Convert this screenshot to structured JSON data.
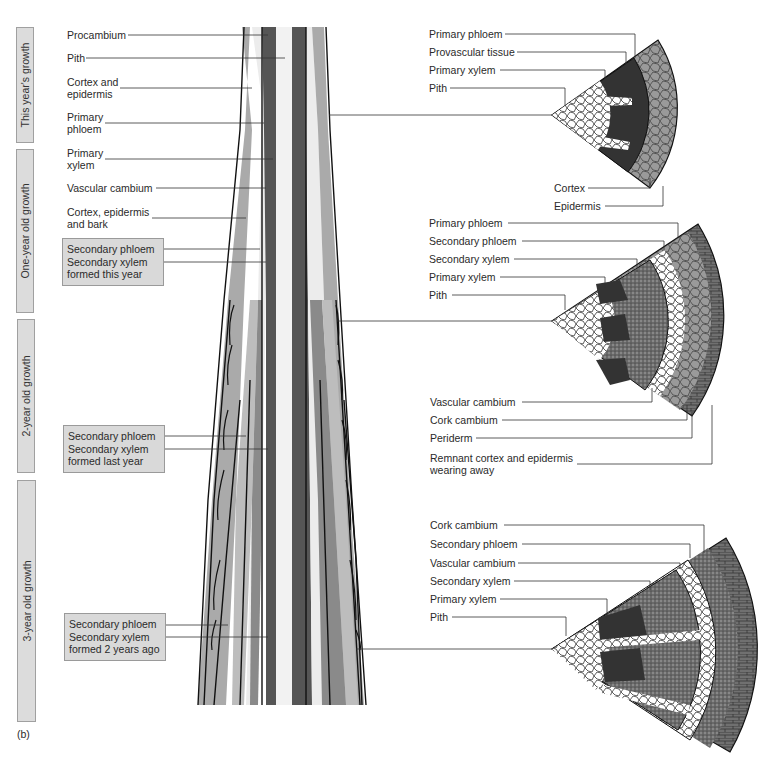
{
  "figure_label": "(b)",
  "growth_bars": [
    {
      "label": "This year's growth"
    },
    {
      "label": "One-year old growth"
    },
    {
      "label": "2-year old growth"
    },
    {
      "label": "3-year old growth"
    }
  ],
  "stem_labels": {
    "procambium": "Procambium",
    "pith": "Pith",
    "cortex_epidermis": [
      "Cortex and",
      "epidermis"
    ],
    "primary_phloem": [
      "Primary",
      "phloem"
    ],
    "primary_xylem": [
      "Primary",
      "xylem"
    ],
    "vascular_cambium": "Vascular cambium",
    "cortex_epidermis_bark": [
      "Cortex, epidermis",
      "and bark"
    ]
  },
  "stem_boxes": [
    {
      "lines": [
        "Secondary phloem",
        "Secondary xylem",
        "formed this year"
      ]
    },
    {
      "lines": [
        "Secondary phloem",
        "Secondary xylem",
        "formed last year"
      ]
    },
    {
      "lines": [
        "Secondary phloem",
        "Secondary xylem",
        "formed 2 years ago"
      ]
    }
  ],
  "section_1": {
    "left_labels": [
      "Primary phloem",
      "Provascular tissue",
      "Primary xylem",
      "Pith"
    ],
    "bottom_labels": [
      "Cortex",
      "Epidermis"
    ]
  },
  "section_2": {
    "top_labels": [
      "Primary phloem",
      "Secondary phloem",
      "Secondary xylem",
      "Primary xylem",
      "Pith"
    ],
    "bottom_labels": [
      "Vascular cambium",
      "Cork cambium",
      "Periderm",
      "Remnant cortex and epidermis",
      "wearing away"
    ]
  },
  "section_3": {
    "top_labels": [
      "Cork cambium",
      "Secondary phloem",
      "Vascular cambium",
      "Secondary xylem",
      "Primary xylem",
      "Pith"
    ]
  },
  "colors": {
    "box_fill": "#d9d9d9",
    "dark_tissue": "#555555",
    "mid_tissue": "#a8a8a8",
    "light_tissue": "#ececec"
  }
}
